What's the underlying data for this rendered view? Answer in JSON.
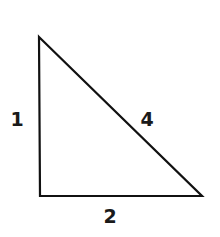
{
  "diagram": {
    "type": "right-triangle",
    "background": "#ffffff",
    "stroke_color": "#111111",
    "stroke_width": 2.2,
    "vertices": {
      "top": [
        39,
        37
      ],
      "bottom_left": [
        40,
        196
      ],
      "bottom_right": [
        202,
        196
      ]
    },
    "labels": {
      "left_side": "1",
      "hypotenuse": "4",
      "bottom_side": "2"
    },
    "label_positions": {
      "left_side": [
        17,
        126
      ],
      "hypotenuse": [
        147,
        126
      ],
      "bottom_side": [
        110,
        223
      ]
    }
  }
}
